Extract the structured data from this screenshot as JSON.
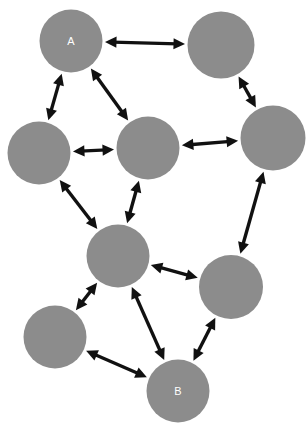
{
  "figure": {
    "name": "undirected-network-graph",
    "width": 307,
    "height": 424,
    "background_color": "#ffffff",
    "node_fill_color": "#8c8c8c",
    "node_label_color": "#ffffff",
    "edge_color": "#111111",
    "edge_style": "double-headed-arrow",
    "node_radius": 31.5
  },
  "nodes": [
    {
      "id": "n1",
      "label": "A",
      "cx": 71,
      "cy": 41,
      "r": 31.5
    },
    {
      "id": "n2",
      "label": "",
      "cx": 221,
      "cy": 45,
      "r": 33.5
    },
    {
      "id": "n3",
      "label": "",
      "cx": 39,
      "cy": 153,
      "r": 31.5
    },
    {
      "id": "n4",
      "label": "",
      "cx": 148,
      "cy": 148,
      "r": 31.5
    },
    {
      "id": "n5",
      "label": "",
      "cx": 273,
      "cy": 138,
      "r": 32.5
    },
    {
      "id": "n6",
      "label": "",
      "cx": 118,
      "cy": 256,
      "r": 31.5
    },
    {
      "id": "n7",
      "label": "",
      "cx": 231,
      "cy": 287,
      "r": 32.0
    },
    {
      "id": "n8",
      "label": "",
      "cx": 55,
      "cy": 337,
      "r": 31.5
    },
    {
      "id": "n9",
      "label": "B",
      "cx": 178,
      "cy": 391,
      "r": 31.5
    }
  ],
  "edges": [
    {
      "from": "n1",
      "to": "n2",
      "arrows": "both"
    },
    {
      "from": "n1",
      "to": "n3",
      "arrows": "both"
    },
    {
      "from": "n1",
      "to": "n4",
      "arrows": "both"
    },
    {
      "from": "n2",
      "to": "n5",
      "arrows": "both"
    },
    {
      "from": "n3",
      "to": "n4",
      "arrows": "both"
    },
    {
      "from": "n4",
      "to": "n5",
      "arrows": "both"
    },
    {
      "from": "n3",
      "to": "n6",
      "arrows": "both"
    },
    {
      "from": "n4",
      "to": "n6",
      "arrows": "both"
    },
    {
      "from": "n5",
      "to": "n7",
      "arrows": "both"
    },
    {
      "from": "n6",
      "to": "n7",
      "arrows": "both"
    },
    {
      "from": "n6",
      "to": "n8",
      "arrows": "both"
    },
    {
      "from": "n6",
      "to": "n9",
      "arrows": "both"
    },
    {
      "from": "n8",
      "to": "n9",
      "arrows": "both"
    },
    {
      "from": "n9",
      "to": "n7",
      "arrows": "both"
    }
  ]
}
